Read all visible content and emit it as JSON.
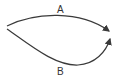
{
  "diagram": {
    "paths": [
      {
        "id": "A",
        "label": "A",
        "direction": "left-to-right",
        "shape": "upper-arc"
      },
      {
        "id": "B",
        "label": "B",
        "direction": "left-to-right",
        "shape": "lower-arc"
      }
    ],
    "colors": {
      "stroke": "#3a3a3a",
      "background": "#ffffff"
    }
  }
}
